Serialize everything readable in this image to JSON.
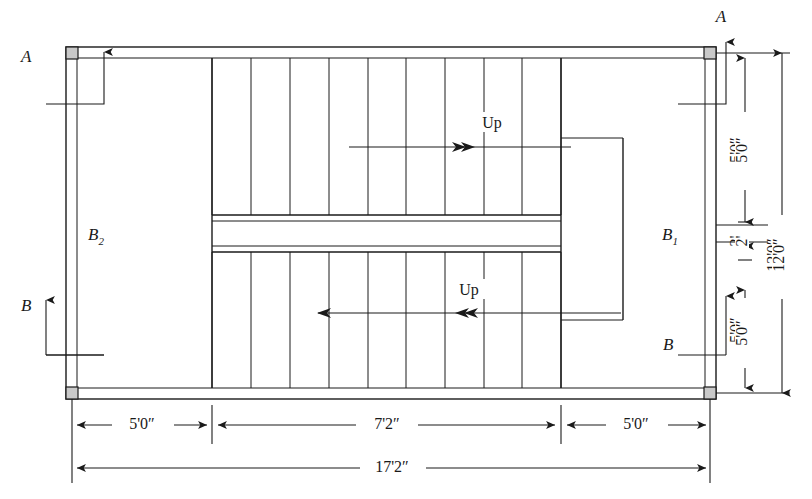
{
  "drawing": {
    "type": "stair-plan",
    "title": "Dog-legged stair plan with beams and columns",
    "section_markers": [
      {
        "id": "A-top-left",
        "label": "A",
        "position": "top-left",
        "direction": "up"
      },
      {
        "id": "A-top-right",
        "label": "A",
        "position": "top-right",
        "direction": "up"
      },
      {
        "id": "B-bottom-left",
        "label": "B",
        "position": "bottom-left",
        "direction": "up"
      },
      {
        "id": "B-bottom-right",
        "label": "B",
        "position": "bottom-right",
        "direction": "up"
      }
    ],
    "beam_labels": [
      {
        "id": "B1",
        "base": "B",
        "sub": "1",
        "side": "right"
      },
      {
        "id": "B2",
        "base": "B",
        "sub": "2",
        "side": "left"
      }
    ],
    "flight_labels": [
      {
        "id": "up-upper",
        "text": "Up",
        "direction": "right"
      },
      {
        "id": "up-lower",
        "text": "Up",
        "direction": "left"
      }
    ],
    "horizontal_dimensions": {
      "chain": [
        {
          "label": "5'0″",
          "from": "left wall",
          "to": "left stair edge"
        },
        {
          "label": "7'2″",
          "from": "left stair edge",
          "to": "right stair edge"
        },
        {
          "label": "5'0″",
          "from": "right stair edge",
          "to": "right wall"
        }
      ],
      "overall": {
        "label": "17'2″"
      }
    },
    "vertical_dimensions": {
      "chain": [
        {
          "label": "5'0″",
          "from": "top wall",
          "to": "landing top"
        },
        {
          "label": "2'",
          "from": "landing top",
          "to": "landing bottom"
        },
        {
          "label": "5'0″",
          "from": "landing bottom",
          "to": "bottom wall"
        }
      ],
      "overall": {
        "label": "12'0″"
      }
    },
    "counts": {
      "upper_flight_treads": 9,
      "lower_flight_treads": 9
    },
    "colors": {
      "line": "#1a1a1a",
      "column_fill": "#c9c9c9",
      "background": "#ffffff"
    }
  }
}
